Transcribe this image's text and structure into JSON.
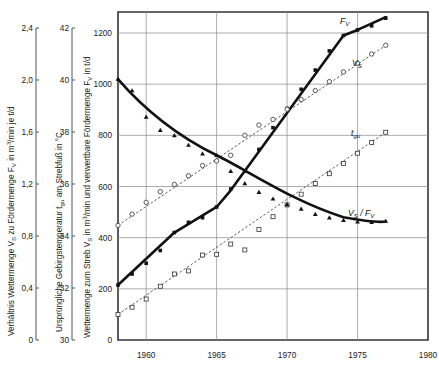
{
  "figure": {
    "background": "#ffffff",
    "ink_color": "#111111",
    "grid_color": "#8a8a8a"
  },
  "axes": {
    "x": {
      "label": "",
      "ticks": [
        1960,
        1965,
        1970,
        1975,
        1980
      ],
      "tick_labels": [
        "1960",
        "1965",
        "1970",
        "1975",
        "1980"
      ],
      "range": [
        1958,
        1980
      ]
    },
    "y_left_1": {
      "title_parts": {
        "p1": "Verhältnis Wettermenge ",
        "v": "V",
        "vsub": "S",
        "p2": " zu Fördermenge ",
        "f": "F",
        "fsub": "V",
        "p3": " in m",
        "sup": "3",
        "p4": "/min je t/d"
      },
      "title_plain": "Verhältnis Wettermenge VS zu Fördermenge FV in m3/min je t/d",
      "ticks": [
        0,
        0.4,
        0.8,
        1.2,
        1.6,
        2.0,
        2.4
      ],
      "tick_labels": [
        "0",
        "0,4",
        "0,8",
        "1,2",
        "1,6",
        "2,0",
        "2,4"
      ],
      "range": [
        0,
        2.4
      ]
    },
    "y_left_2": {
      "title_parts": {
        "p1": "Ursprüngliche Gebirgstemperatur ",
        "t": "t",
        "tsub": "gu",
        "p2": " am Strebfuß in °C"
      },
      "title_plain": "Ursprüngliche Gebirgstemperatur tgu am Strebfuß in °C",
      "ticks": [
        30,
        32,
        34,
        36,
        38,
        40,
        42
      ],
      "tick_labels": [
        "30",
        "32",
        "34",
        "36",
        "38",
        "40",
        "42"
      ],
      "range": [
        30,
        42
      ]
    },
    "y_main": {
      "title_parts": {
        "p1": "Wettermenge zum Streb ",
        "v": "V",
        "vsub": "S",
        "p2": " in m",
        "sup": "3",
        "p3": "/min und verwertbare Fördermenge ",
        "f": "F",
        "fsub": "V",
        "p4": " in t/d"
      },
      "title_plain": "Wettermenge zum Streb VS in m3/min und verwertbare Fördermenge FV in t/d",
      "ticks": [
        0,
        200,
        400,
        600,
        800,
        1000,
        1200
      ],
      "tick_labels": [
        "0",
        "200",
        "400",
        "600",
        "800",
        "1000",
        "1200"
      ],
      "range": [
        0,
        1300
      ]
    }
  },
  "curve_labels": {
    "fv": {
      "base": "F",
      "sub": "V"
    },
    "vs": {
      "base": "V",
      "sub": "S"
    },
    "tgu": {
      "base": "t",
      "sub": "gu"
    },
    "ratio": {
      "num": "V",
      "numsub": "S",
      "slash": " / ",
      "den": "F",
      "densub": "V"
    }
  },
  "chart_data": {
    "type": "line",
    "title": "",
    "xlabel": "",
    "ylabel": "Wettermenge zum Streb VS in m3/min und verwertbare Fördermenge FV in t/d",
    "xlim": [
      1958,
      1980
    ],
    "ylim": [
      0,
      1300
    ],
    "grid": true,
    "legend": "inline-curve-labels",
    "x": [
      1958,
      1959,
      1960,
      1961,
      1962,
      1963,
      1964,
      1965,
      1966,
      1967,
      1968,
      1969,
      1970,
      1971,
      1972,
      1973,
      1974,
      1975,
      1976,
      1977
    ],
    "series": [
      {
        "name": "F_V",
        "label": "FV",
        "description": "verwertbare Fördermenge in t/d",
        "style": "thick-solid",
        "marker": "filled-square",
        "axis": "y_main",
        "values": [
          215,
          258,
          300,
          350,
          420,
          460,
          478,
          520,
          590,
          660,
          745,
          830,
          905,
          980,
          1055,
          1130,
          1190,
          1212,
          1228,
          1258
        ]
      },
      {
        "name": "V_S",
        "label": "VS",
        "description": "Wettermenge zum Streb in m3/min",
        "style": "dotted",
        "marker": "open-circle",
        "axis": "y_main",
        "values": [
          448,
          492,
          538,
          580,
          608,
          642,
          682,
          700,
          722,
          800,
          840,
          862,
          902,
          940,
          975,
          1010,
          1048,
          1082,
          1118,
          1152
        ]
      },
      {
        "name": "t_gu",
        "label": "tgu",
        "description": "Ursprüngliche Gebirgstemperatur am Strebfuß in °C",
        "style": "dotted",
        "marker": "open-square",
        "axis": "y_left_2",
        "values_main_scale": [
          100,
          128,
          160,
          210,
          258,
          270,
          332,
          335,
          375,
          352,
          432,
          482,
          528,
          570,
          612,
          650,
          690,
          730,
          772,
          812
        ],
        "values_celsius": [
          32.6,
          32.9,
          33.1,
          33.6,
          34.0,
          34.1,
          34.7,
          34.7,
          35.1,
          34.9,
          35.6,
          36.1,
          36.5,
          36.9,
          37.2,
          37.6,
          37.9,
          38.3,
          38.7,
          39.0
        ]
      },
      {
        "name": "V_S/F_V",
        "label": "VS/FV",
        "description": "Verhältnis Wettermenge zu Fördermenge in m3/min je t/d",
        "style": "thick-solid",
        "marker": "filled-triangle",
        "axis": "y_left_1",
        "values_main_scale": [
          1020,
          975,
          872,
          820,
          800,
          762,
          728,
          722,
          660,
          612,
          578,
          552,
          530,
          512,
          492,
          478,
          468,
          462,
          460,
          465
        ],
        "values_ratio": [
          2.04,
          1.95,
          1.74,
          1.64,
          1.6,
          1.52,
          1.46,
          1.44,
          1.32,
          1.22,
          1.16,
          1.1,
          1.06,
          1.02,
          0.98,
          0.96,
          0.94,
          0.92,
          0.92,
          0.93
        ]
      }
    ]
  }
}
